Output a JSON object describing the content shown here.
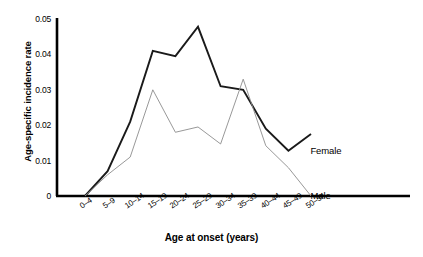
{
  "chart_data": {
    "type": "line",
    "title": "",
    "xlabel": "Age at onset (years)",
    "ylabel": "Age-specific incidence rate",
    "categories": [
      "0–4",
      "5–9",
      "10–14",
      "15–19",
      "20–24",
      "25–29",
      "30–34",
      "35–39",
      "40–44",
      "45–49",
      "50–54"
    ],
    "series": [
      {
        "name": "Female",
        "color": "#1a1a1a",
        "values": [
          0,
          0.007,
          0.021,
          0.041,
          0.0395,
          0.0478,
          0.031,
          0.03,
          0.019,
          0.0128,
          0.0175
        ]
      },
      {
        "name": "Male",
        "color": "#8c8c8c",
        "values": [
          0,
          0.006,
          0.011,
          0.03,
          0.018,
          0.0195,
          0.0147,
          0.033,
          0.0142,
          0.008,
          0
        ]
      }
    ],
    "yticks": [
      "0",
      "0.01",
      "0.02",
      "0.03",
      "0.04",
      "0.05"
    ],
    "ytick_values": [
      0,
      0.01,
      0.02,
      0.03,
      0.04,
      0.05
    ],
    "ylim": [
      0,
      0.05
    ],
    "grid": false,
    "legend": "inline-labels",
    "legend_entries": [
      {
        "label": "Female"
      },
      {
        "label": "Male"
      }
    ]
  }
}
